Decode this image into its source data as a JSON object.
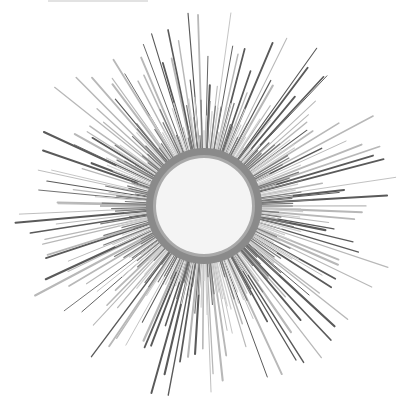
{
  "image": {
    "subject": "Silver sunburst wall mirror",
    "background": "#ffffff",
    "center": [
      204,
      206
    ],
    "frame_outer_radius": 58,
    "frame_inner_radius": 48,
    "frame_color": "#8a8a8a",
    "glass_color": "#f4f4f4",
    "ray_color_dark": "#5a5a5a",
    "ray_color_light": "#b8b8b8",
    "ray_count": 150,
    "ray_min_length": 120,
    "ray_max_length": 195
  }
}
